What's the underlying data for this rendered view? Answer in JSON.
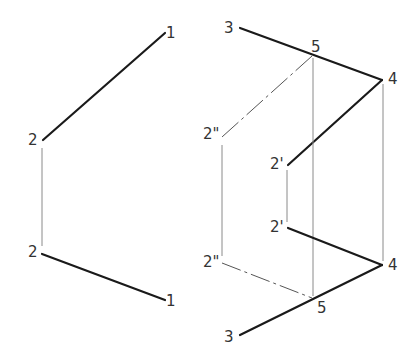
{
  "diagram": {
    "type": "orthographic-projection",
    "colors": {
      "object_line": "#1a1a1a",
      "projector_line": "#8a8a8a",
      "hidden_line": "#555555",
      "label": "#333333",
      "background": "#ffffff"
    },
    "left_view": {
      "labels": [
        {
          "id": "l1-top",
          "text": "1",
          "x": 166,
          "y": 26
        },
        {
          "id": "l2-top",
          "text": "2",
          "x": 28,
          "y": 133
        },
        {
          "id": "l2-bot",
          "text": "2",
          "x": 28,
          "y": 245
        },
        {
          "id": "l1-bot",
          "text": "1",
          "x": 166,
          "y": 294
        }
      ]
    },
    "right_view": {
      "labels": [
        {
          "id": "r3-top",
          "text": "3",
          "x": 224,
          "y": 21
        },
        {
          "id": "r5-top",
          "text": "5",
          "x": 311,
          "y": 40
        },
        {
          "id": "r4-top",
          "text": "4",
          "x": 388,
          "y": 72
        },
        {
          "id": "r2pp-top",
          "text": "2\"",
          "x": 203,
          "y": 127
        },
        {
          "id": "r2p-top",
          "text": "2'",
          "x": 270,
          "y": 157
        },
        {
          "id": "r2p-bot",
          "text": "2'",
          "x": 270,
          "y": 220
        },
        {
          "id": "r2pp-bot",
          "text": "2\"",
          "x": 203,
          "y": 255
        },
        {
          "id": "r4-bot",
          "text": "4",
          "x": 388,
          "y": 258
        },
        {
          "id": "r5-bot",
          "text": "5",
          "x": 317,
          "y": 301
        },
        {
          "id": "r3-bot",
          "text": "3",
          "x": 224,
          "y": 330
        }
      ]
    }
  }
}
